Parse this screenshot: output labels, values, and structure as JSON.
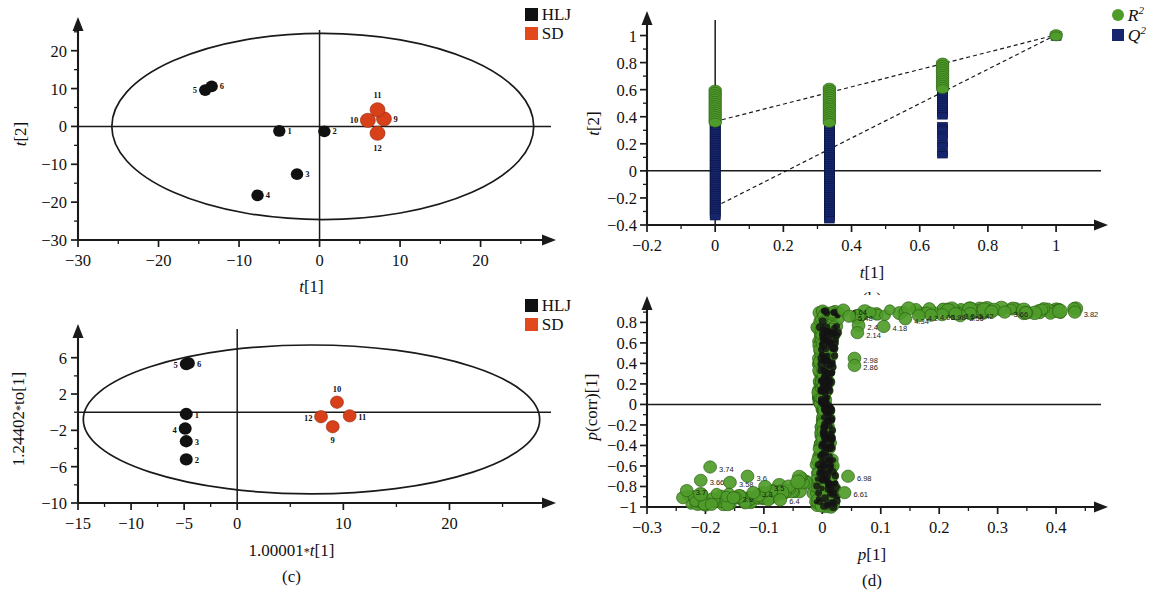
{
  "figure": {
    "panels": [
      "(a)",
      "(b)",
      "(c)",
      "(d)"
    ]
  },
  "panel_a": {
    "letter": "(a)",
    "xlabel": "t[1]",
    "ylabel": "t[2]",
    "legend": [
      {
        "label": "HLJ",
        "color": "#111111",
        "marker": "square"
      },
      {
        "label": "SD",
        "color": "#e2491d",
        "marker": "square"
      }
    ]
  },
  "panel_b": {
    "letter": "(b)",
    "xlabel": "t[1]",
    "ylabel": "t[2]",
    "legend": [
      {
        "label": "R",
        "sup": "2",
        "color": "#4f9c2a",
        "marker": "circle"
      },
      {
        "label": "Q",
        "sup": "2",
        "color": "#16266e",
        "marker": "square"
      }
    ]
  },
  "panel_c": {
    "letter": "(c)",
    "xlabel": "1.00001*t[1]",
    "ylabel": "1.24402*to[1]",
    "legend": [
      {
        "label": "HLJ",
        "color": "#111111",
        "marker": "square"
      },
      {
        "label": "SD",
        "color": "#e2491d",
        "marker": "square"
      }
    ]
  },
  "panel_d": {
    "letter": "(d)",
    "xlabel": "p[1]",
    "ylabel": "p(corr)[1]"
  },
  "chart_data": [
    {
      "id": "a",
      "type": "scatter",
      "title": "",
      "xlabel": "t[1]",
      "ylabel": "t[2]",
      "xlim": [
        -30,
        28
      ],
      "ylim": [
        -30,
        26
      ],
      "xticks": [
        -30,
        -20,
        -10,
        0,
        10,
        20
      ],
      "yticks": [
        -30,
        -20,
        -10,
        0,
        10,
        20
      ],
      "grid": false,
      "legend_position": "top-right",
      "hotelling_ellipse": {
        "cx": 0.4,
        "cy": 0.0,
        "rx": 26.2,
        "ry": 24.6
      },
      "series": [
        {
          "name": "HLJ",
          "color": "#111111",
          "points": [
            {
              "label": "1",
              "x": -5.0,
              "y": -1.2,
              "label_pos": "right"
            },
            {
              "label": "2",
              "x": 0.6,
              "y": -1.3,
              "label_pos": "right"
            },
            {
              "label": "3",
              "x": -2.8,
              "y": -12.6,
              "label_pos": "right"
            },
            {
              "label": "4",
              "x": -7.7,
              "y": -18.2,
              "label_pos": "right"
            },
            {
              "label": "5",
              "x": -14.2,
              "y": 9.6,
              "label_pos": "left"
            },
            {
              "label": "6",
              "x": -13.4,
              "y": 10.6,
              "label_pos": "right"
            }
          ]
        },
        {
          "name": "SD",
          "color": "#e2491d",
          "points": [
            {
              "label": "9",
              "x": 8.0,
              "y": 2.0,
              "label_pos": "right"
            },
            {
              "label": "10",
              "x": 6.0,
              "y": 1.6,
              "label_pos": "left"
            },
            {
              "label": "11",
              "x": 7.2,
              "y": 4.4,
              "label_pos": "top"
            },
            {
              "label": "12",
              "x": 7.2,
              "y": -1.8,
              "label_pos": "bottom"
            }
          ]
        }
      ]
    },
    {
      "id": "b",
      "type": "scatter",
      "title": "Permutation test",
      "xlabel": "t[1]",
      "ylabel": "t[2]",
      "xlim": [
        -0.2,
        1.12
      ],
      "ylim": [
        -0.4,
        1.1
      ],
      "xticks": [
        -0.2,
        0,
        0.2,
        0.4,
        0.6,
        0.8,
        1
      ],
      "yticks": [
        -0.4,
        -0.2,
        0,
        0.2,
        0.4,
        0.6,
        0.8,
        1
      ],
      "grid": false,
      "legend_position": "top-right",
      "series": [
        {
          "name": "R2",
          "color": "#4f9c2a",
          "columns": [
            {
              "x": 0.0,
              "ymin": 0.355,
              "ymax": 0.6
            },
            {
              "x": 0.335,
              "ymin": 0.35,
              "ymax": 0.615
            },
            {
              "x": 0.667,
              "ymin": 0.6,
              "ymax": 0.8
            },
            {
              "x": 1.0,
              "ymin": 0.99,
              "ymax": 1.01
            }
          ],
          "regression": {
            "intercept": 0.365,
            "slope": 0.64
          }
        },
        {
          "name": "Q2",
          "color": "#16266e",
          "columns": [
            {
              "x": 0.0,
              "ymin": -0.345,
              "ymax": 0.36
            },
            {
              "x": 0.335,
              "ymin": -0.375,
              "ymax": 0.37
            },
            {
              "x": 0.667,
              "ymin": 0.1,
              "ymax": 0.585
            },
            {
              "x": 1.0,
              "ymin": 0.985,
              "ymax": 1.005
            }
          ],
          "regression": {
            "intercept": -0.265,
            "slope": 1.27
          }
        }
      ]
    },
    {
      "id": "c",
      "type": "scatter",
      "title": "OPLS-DA score plot",
      "xlabel": "1.00001*t[1]",
      "ylabel": "1.24402*to[1]",
      "xlim": [
        -15,
        29
      ],
      "ylim": [
        -10,
        8.5
      ],
      "xticks": [
        -15,
        -10,
        -5,
        0,
        10,
        20
      ],
      "yticks": [
        -10,
        -6,
        -2,
        2,
        6
      ],
      "grid": false,
      "legend_position": "top-right",
      "hotelling_ellipse": {
        "cx": 7.0,
        "cy": -0.8,
        "rx": 21.5,
        "ry": 8.2
      },
      "series": [
        {
          "name": "HLJ",
          "color": "#111111",
          "points": [
            {
              "label": "1",
              "x": -4.8,
              "y": -0.2,
              "label_pos": "right"
            },
            {
              "label": "2",
              "x": -4.8,
              "y": -5.2,
              "label_pos": "right"
            },
            {
              "label": "3",
              "x": -4.8,
              "y": -3.2,
              "label_pos": "right"
            },
            {
              "label": "4",
              "x": -4.9,
              "y": -1.8,
              "label_pos": "left"
            },
            {
              "label": "5",
              "x": -4.8,
              "y": 5.3,
              "label_pos": "left"
            },
            {
              "label": "6",
              "x": -4.6,
              "y": 5.4,
              "label_pos": "right"
            }
          ]
        },
        {
          "name": "SD",
          "color": "#e2491d",
          "points": [
            {
              "label": "9",
              "x": 9.0,
              "y": -1.6,
              "label_pos": "bottom"
            },
            {
              "label": "10",
              "x": 9.4,
              "y": 1.1,
              "label_pos": "top"
            },
            {
              "label": "11",
              "x": 10.6,
              "y": -0.4,
              "label_pos": "right"
            },
            {
              "label": "12",
              "x": 7.9,
              "y": -0.5,
              "label_pos": "left"
            }
          ]
        }
      ]
    },
    {
      "id": "d",
      "type": "scatter",
      "title": "S-plot",
      "xlabel": "p[1]",
      "ylabel": "p(corr)[1]",
      "xlim": [
        -0.3,
        0.47
      ],
      "ylim": [
        -1,
        0.95
      ],
      "xticks": [
        -0.3,
        -0.2,
        -0.1,
        0,
        0.1,
        0.2,
        0.3,
        0.4
      ],
      "yticks": [
        -1,
        -0.8,
        -0.6,
        -0.4,
        -0.2,
        0,
        0.2,
        0.4,
        0.6,
        0.8
      ],
      "grid": false,
      "legend_position": "none",
      "marker_color": "#4f9c2a",
      "labeled_points": [
        {
          "label": "3.82",
          "x": 0.432,
          "y": 0.9
        },
        {
          "label": "3.66",
          "x": 0.312,
          "y": 0.9
        },
        {
          "label": "5.42",
          "x": 0.253,
          "y": 0.885
        },
        {
          "label": "3.56",
          "x": 0.236,
          "y": 0.865
        },
        {
          "label": "3.5",
          "x": 0.228,
          "y": 0.885
        },
        {
          "label": "3.98",
          "x": 0.205,
          "y": 0.875
        },
        {
          "label": "4.06",
          "x": 0.186,
          "y": 0.87
        },
        {
          "label": "4.2",
          "x": 0.165,
          "y": 0.865
        },
        {
          "label": "4.34",
          "x": 0.142,
          "y": 0.835
        },
        {
          "label": "4.18",
          "x": 0.105,
          "y": 0.76
        },
        {
          "label": "2.4",
          "x": 0.062,
          "y": 0.77
        },
        {
          "label": "2.14",
          "x": 0.06,
          "y": 0.7
        },
        {
          "label": "5.64",
          "x": 0.036,
          "y": 0.92
        },
        {
          "label": "5.48",
          "x": 0.046,
          "y": 0.86
        },
        {
          "label": "2.98",
          "x": 0.055,
          "y": 0.45
        },
        {
          "label": "2.86",
          "x": 0.055,
          "y": 0.38
        },
        {
          "label": "6.98",
          "x": 0.044,
          "y": -0.7
        },
        {
          "label": "6.61",
          "x": 0.038,
          "y": -0.86
        },
        {
          "label": "3.74",
          "x": -0.192,
          "y": -0.61
        },
        {
          "label": "3.7",
          "x": -0.232,
          "y": -0.84
        },
        {
          "label": "3.66",
          "x": -0.208,
          "y": -0.74
        },
        {
          "label": "3.58",
          "x": -0.158,
          "y": -0.76
        },
        {
          "label": "3.9",
          "x": -0.152,
          "y": -0.91
        },
        {
          "label": "3.6",
          "x": -0.128,
          "y": -0.7
        },
        {
          "label": "3.3",
          "x": -0.118,
          "y": -0.86
        },
        {
          "label": "3.5",
          "x": -0.098,
          "y": -0.8
        },
        {
          "label": "6.4",
          "x": -0.072,
          "y": -0.93
        }
      ]
    }
  ]
}
